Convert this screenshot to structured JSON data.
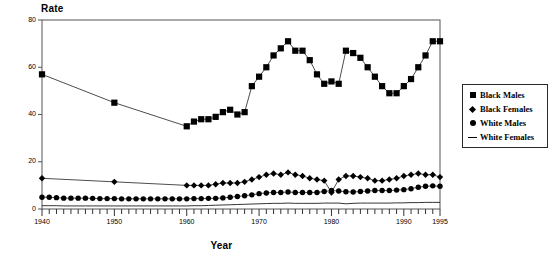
{
  "chart_data": {
    "type": "line",
    "title": "",
    "xlabel": "Year",
    "ylabel": "Rate",
    "xlim": [
      1940,
      1995
    ],
    "ylim": [
      0,
      80
    ],
    "yticks": [
      0,
      20,
      40,
      60,
      80
    ],
    "xticks": [
      1940,
      1950,
      1960,
      1970,
      1980,
      1990,
      1995
    ],
    "xtick_minor_step": 1,
    "grid": false,
    "legend_position": "right-outside",
    "series": [
      {
        "name": "Black Males",
        "marker": "square",
        "color": "#000000",
        "x": [
          1940,
          1950,
          1960,
          1961,
          1962,
          1963,
          1964,
          1965,
          1966,
          1967,
          1968,
          1969,
          1970,
          1971,
          1972,
          1973,
          1974,
          1975,
          1976,
          1977,
          1978,
          1979,
          1980,
          1981,
          1982,
          1983,
          1984,
          1985,
          1986,
          1987,
          1988,
          1989,
          1990,
          1991,
          1992,
          1993,
          1994,
          1995
        ],
        "values": [
          57,
          45,
          35,
          37,
          38,
          38,
          39,
          41,
          42,
          40,
          41,
          52,
          56,
          60,
          65,
          68,
          71,
          67,
          67,
          63,
          57,
          53,
          54,
          53,
          67,
          66,
          64,
          60,
          56,
          52,
          49,
          49,
          52,
          55,
          60,
          65,
          71,
          71
        ]
      },
      {
        "name": "Black Females",
        "marker": "diamond",
        "color": "#000000",
        "x": [
          1940,
          1950,
          1960,
          1961,
          1962,
          1963,
          1964,
          1965,
          1966,
          1967,
          1968,
          1969,
          1970,
          1971,
          1972,
          1973,
          1974,
          1975,
          1976,
          1977,
          1978,
          1979,
          1980,
          1981,
          1982,
          1983,
          1984,
          1985,
          1986,
          1987,
          1988,
          1989,
          1990,
          1991,
          1992,
          1993,
          1994,
          1995
        ],
        "values": [
          13,
          11.5,
          10,
          10,
          10,
          10,
          10.5,
          11,
          11,
          11,
          11.5,
          12.5,
          13.5,
          14.5,
          15,
          14.5,
          15.5,
          14.5,
          14,
          13,
          12.5,
          12,
          7,
          12.5,
          14,
          14,
          13.5,
          13,
          12,
          12,
          12.5,
          13,
          14,
          14.5,
          15,
          14.5,
          14.5,
          13.5
        ]
      },
      {
        "name": "White Males",
        "marker": "circle",
        "color": "#000000",
        "x": [
          1940,
          1941,
          1942,
          1943,
          1944,
          1945,
          1946,
          1947,
          1948,
          1949,
          1950,
          1951,
          1952,
          1953,
          1954,
          1955,
          1956,
          1957,
          1958,
          1959,
          1960,
          1961,
          1962,
          1963,
          1964,
          1965,
          1966,
          1967,
          1968,
          1969,
          1970,
          1971,
          1972,
          1973,
          1974,
          1975,
          1976,
          1977,
          1978,
          1979,
          1980,
          1981,
          1982,
          1983,
          1984,
          1985,
          1986,
          1987,
          1988,
          1989,
          1990,
          1991,
          1992,
          1993,
          1994,
          1995
        ],
        "values": [
          5,
          5,
          4.8,
          4.6,
          4.6,
          4.6,
          4.6,
          4.5,
          4.4,
          4.4,
          4.4,
          4.3,
          4.3,
          4.3,
          4.3,
          4.3,
          4.3,
          4.3,
          4.3,
          4.3,
          4.3,
          4.4,
          4.4,
          4.5,
          4.5,
          4.7,
          5,
          5.3,
          5.6,
          6,
          6.5,
          6.8,
          7,
          7,
          7.2,
          7,
          7,
          7,
          7,
          7.4,
          7.8,
          7.6,
          7.3,
          7.2,
          7.4,
          7.6,
          7.8,
          7.8,
          7.8,
          8,
          8.2,
          8.6,
          9.2,
          9.6,
          9.8,
          9.6
        ]
      },
      {
        "name": "White Females",
        "marker": "line",
        "color": "#000000",
        "x": [
          1940,
          1941,
          1942,
          1943,
          1944,
          1945,
          1946,
          1947,
          1948,
          1949,
          1950,
          1951,
          1952,
          1953,
          1954,
          1955,
          1956,
          1957,
          1958,
          1959,
          1960,
          1961,
          1962,
          1963,
          1964,
          1965,
          1966,
          1967,
          1968,
          1969,
          1970,
          1971,
          1972,
          1973,
          1974,
          1975,
          1976,
          1977,
          1978,
          1979,
          1980,
          1981,
          1982,
          1983,
          1984,
          1985,
          1986,
          1987,
          1988,
          1989,
          1990,
          1991,
          1992,
          1993,
          1994,
          1995
        ],
        "values": [
          1.4,
          1.4,
          1.4,
          1.3,
          1.3,
          1.3,
          1.3,
          1.3,
          1.3,
          1.3,
          1.3,
          1.3,
          1.3,
          1.3,
          1.3,
          1.3,
          1.3,
          1.3,
          1.3,
          1.3,
          1.3,
          1.4,
          1.4,
          1.5,
          1.6,
          1.7,
          1.8,
          1.9,
          2.0,
          2.1,
          2.2,
          2.3,
          2.4,
          2.4,
          2.5,
          2.4,
          2.4,
          2.4,
          2.4,
          2.5,
          2.5,
          2.5,
          2.2,
          2.4,
          2.5,
          2.5,
          2.5,
          2.5,
          2.5,
          2.6,
          2.6,
          2.7,
          2.7,
          2.8,
          2.8,
          2.8
        ]
      }
    ]
  },
  "legend": {
    "items": [
      {
        "label": "Black Males",
        "key": "square"
      },
      {
        "label": "Black Females",
        "key": "diamond"
      },
      {
        "label": "White Males",
        "key": "circle"
      },
      {
        "label": "White Females",
        "key": "line"
      }
    ]
  }
}
